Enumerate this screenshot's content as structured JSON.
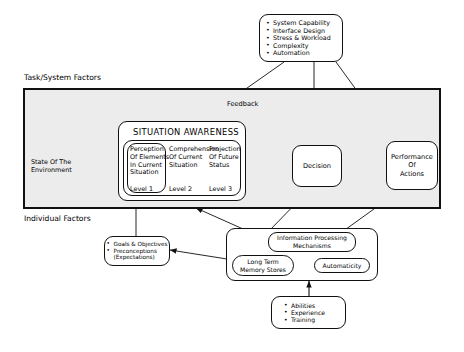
{
  "diagram": {
    "section_labels": {
      "task_system": "Task/System Factors",
      "individual": "Individual Factors",
      "feedback": "Feedback"
    },
    "task_system_factors": {
      "name": "task-system-factors-box",
      "items": [
        "System Capability",
        "Interface Design",
        "Stress & Workload",
        "Complexity",
        "Automation"
      ]
    },
    "state_of_environment": {
      "label": "State Of The\nEnvironment",
      "line1": "State Of The",
      "line2": "Environment"
    },
    "situation_awareness": {
      "title": "SITUATION AWARENESS",
      "levels": [
        {
          "level": "Level 1",
          "lines": [
            "Perception",
            "Of Elements",
            "In Current",
            "Situation"
          ]
        },
        {
          "level": "Level 2",
          "lines": [
            "Comprehension",
            "Of Current",
            "Situation"
          ]
        },
        {
          "level": "Level 3",
          "lines": [
            "Projection",
            "Of Future",
            "Status"
          ]
        }
      ]
    },
    "decision": {
      "label": "Decision"
    },
    "performance": {
      "lines": [
        "Performance",
        "Of",
        "Actions"
      ]
    },
    "goals_box": {
      "items": [
        "Goals & Objectives",
        "Preconceptions"
      ],
      "subitem": "(Expectations)"
    },
    "information_processing": {
      "title_line1": "Information Processing",
      "title_line2": "Mechanisms",
      "long_term_memory_line1": "Long Term",
      "long_term_memory_line2": "Memory Stores",
      "automaticity": "Automaticity"
    },
    "abilities_box": {
      "items": [
        "Abilities",
        "Experience",
        "Training"
      ]
    },
    "colors": {
      "frame_fill": "#ececed",
      "stroke": "#111111",
      "node_fill": "#ffffff",
      "page": "#ffffff"
    }
  }
}
